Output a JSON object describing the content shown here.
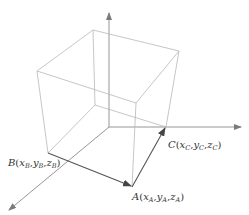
{
  "diagram": {
    "type": "3d-cube-with-axes",
    "colors": {
      "background": "#ffffff",
      "cube_edge": "#b8b8b8",
      "axis": "#8a8a8a",
      "vector": "#555555",
      "label": "#333333"
    },
    "axes": {
      "origin": [
        109,
        127
      ],
      "vertical_tip": [
        109,
        13
      ],
      "horizontal_tip": [
        241,
        127
      ],
      "diagonal_tip": [
        9,
        210
      ]
    },
    "cube_vertices": {
      "top_left": [
        37,
        71
      ],
      "top_back": [
        93,
        30
      ],
      "top_right": [
        179,
        51
      ],
      "top_front": [
        136,
        103
      ],
      "bottom_left_B": [
        48,
        153
      ],
      "bottom_back": [
        95,
        105
      ],
      "bottom_right_C": [
        166,
        127
      ],
      "bottom_front_A": [
        132,
        187
      ]
    },
    "vectors": [
      {
        "name": "B-to-A",
        "from": "B",
        "to": "A"
      },
      {
        "name": "A-to-C",
        "from": "A",
        "to": "C"
      }
    ],
    "points": {
      "A": {
        "name": "A",
        "x": "x",
        "y": "y",
        "z": "z",
        "sub": "A"
      },
      "B": {
        "name": "B",
        "x": "x",
        "y": "y",
        "z": "z",
        "sub": "B"
      },
      "C": {
        "name": "C",
        "x": "x",
        "y": "y",
        "z": "z",
        "sub": "C"
      }
    }
  }
}
